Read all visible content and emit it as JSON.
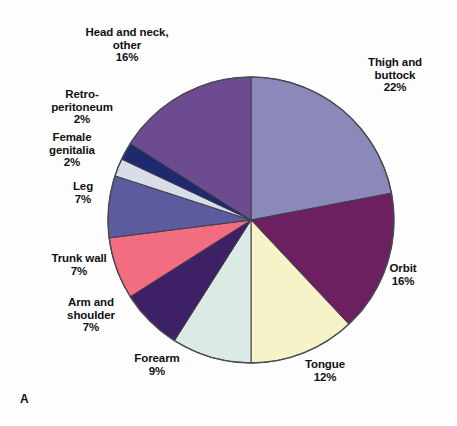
{
  "figure": {
    "letter": "A",
    "background_color": "#fdfdfd"
  },
  "chart_data": {
    "type": "pie",
    "title": "",
    "subtitle": "",
    "xlabel": "",
    "ylabel": "",
    "legend_position": "none",
    "grid": false,
    "units": "percent",
    "start_angle_deg": 0,
    "direction": "clockwise",
    "center": {
      "x": 251,
      "y": 220
    },
    "radius": 143,
    "categories": [
      "Thigh and buttock",
      "Orbit",
      "Tongue",
      "Forearm",
      "Arm and shoulder",
      "Trunk wall",
      "Leg",
      "Female genitalia",
      "Retroperitoneum",
      "Head and neck, other"
    ],
    "values": [
      22,
      16,
      12,
      9,
      7,
      7,
      7,
      2,
      2,
      16
    ],
    "colors": [
      "#8b88ba",
      "#6d2061",
      "#f6f3c9",
      "#dceae4",
      "#3d2066",
      "#f26d80",
      "#5b5b9e",
      "#d9dde9",
      "#1f2a6e",
      "#6d4b91"
    ],
    "slices": [
      {
        "label": "Thigh and buttock",
        "value": 22,
        "value_text": "22%",
        "color": "#8b88ba"
      },
      {
        "label": "Orbit",
        "value": 16,
        "value_text": "16%",
        "color": "#6d2061"
      },
      {
        "label": "Tongue",
        "value": 12,
        "value_text": "12%",
        "color": "#f6f3c9"
      },
      {
        "label": "Forearm",
        "value": 9,
        "value_text": "9%",
        "color": "#dceae4"
      },
      {
        "label": "Arm and shoulder",
        "value": 7,
        "value_text": "7%",
        "color": "#3d2066"
      },
      {
        "label": "Trunk wall",
        "value": 7,
        "value_text": "7%",
        "color": "#f26d80"
      },
      {
        "label": "Leg",
        "value": 7,
        "value_text": "7%",
        "color": "#5b5b9e"
      },
      {
        "label": "Female genitalia",
        "value": 2,
        "value_text": "2%",
        "color": "#d9dde9"
      },
      {
        "label": "Retroperitoneum",
        "value": 2,
        "value_text": "2%",
        "color": "#1f2a6e"
      },
      {
        "label": "Head and neck, other",
        "value": 16,
        "value_text": "16%",
        "color": "#6d4b91"
      }
    ]
  },
  "labels": {
    "head_neck": "Head and neck,\nother\n16%",
    "retroperitoneum": "Retro-\nperitoneum\n2%",
    "female_genitalia": "Female\ngenitalia\n2%",
    "leg": "Leg\n7%",
    "trunk_wall": "Trunk wall\n7%",
    "arm_shoulder": "Arm and\nshoulder\n7%",
    "forearm": "Forearm\n9%",
    "tongue": "Tongue\n12%",
    "orbit": "Orbit\n16%",
    "thigh_buttock": "Thigh and\nbuttock\n22%"
  }
}
